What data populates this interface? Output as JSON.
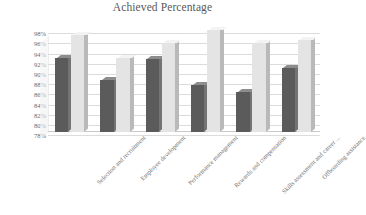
{
  "chart_data": {
    "type": "bar",
    "title": "Achieved Percentage",
    "xlabel": "",
    "ylabel": "",
    "ylim": [
      78,
      98
    ],
    "ytick_labels": [
      "98%",
      "96%",
      "94%",
      "92%",
      "90%",
      "88%",
      "86%",
      "84%",
      "82%",
      "80%",
      "78%"
    ],
    "ytick_values": [
      98,
      96,
      94,
      92,
      90,
      88,
      86,
      84,
      82,
      80,
      78
    ],
    "grid": true,
    "legend": "none",
    "style": "3d-clustered-column",
    "categories": [
      "Selection and recruitment",
      "Employee development",
      "Performance management",
      "Rewards and compensation",
      "Skills assessment and career ...",
      "Offboarding assistance"
    ],
    "series": [
      {
        "name": "Series 1",
        "color": "#5b5b5b",
        "values": [
          92.5,
          88.2,
          92.4,
          87.3,
          85.8,
          90.6
        ]
      },
      {
        "name": "Series 2",
        "color": "#e4e4e4",
        "values": [
          97.0,
          92.5,
          95.5,
          98.0,
          95.5,
          96.0
        ]
      }
    ]
  },
  "colors": {
    "series_a": "#5b5b5b",
    "series_b": "#e4e4e4",
    "gridline": "#dcdcdc",
    "text": "#5a5a5a",
    "background": "#ffffff"
  }
}
